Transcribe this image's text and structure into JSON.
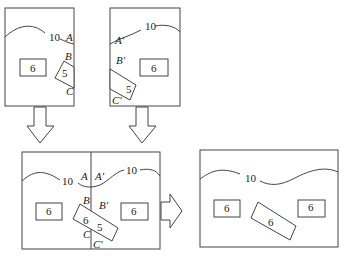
{
  "panels": {
    "top_left": {
      "contour_label": "10",
      "points": [
        "A",
        "B",
        "C"
      ],
      "block_left": "6",
      "block_tilted": "5"
    },
    "top_right": {
      "contour_label": "10",
      "points": [
        "A'",
        "B'",
        "C'"
      ],
      "block_right": "6",
      "block_tilted": "5"
    },
    "bottom_merged": {
      "contour_left_label": "10",
      "contour_right_label": "10",
      "points_left": [
        "A",
        "B",
        "C"
      ],
      "points_right": [
        "A'",
        "B'",
        "C'"
      ],
      "block_left": "6",
      "block_right": "6",
      "tilted_left": "6",
      "tilted_right": "5"
    },
    "bottom_result": {
      "contour_label": "10",
      "block_left": "6",
      "block_tilted": "6",
      "block_right": "6"
    }
  },
  "arrows": [
    "down-arrow-left",
    "down-arrow-right",
    "right-arrow"
  ],
  "colors": {
    "line": "#444444",
    "background": "#ffffff"
  }
}
